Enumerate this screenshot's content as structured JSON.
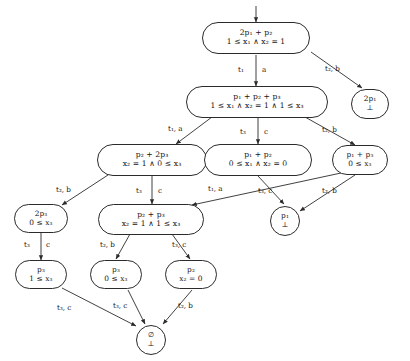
{
  "diagram": {
    "type": "directed-graph",
    "background": "#ffffff",
    "stroke": "#2b2b2b",
    "nodes": [
      {
        "id": "n0",
        "marking": "2p₁ + p₂",
        "guard": "1 ≤ x₁ ∧ x₂ = 1",
        "shape": "rounded"
      },
      {
        "id": "n1",
        "marking": "p₁ + p₂ + p₃",
        "guard": "1 ≤ x₁ ∧ x₂ = 1 ∧ 1 ≤ x₃",
        "shape": "rounded"
      },
      {
        "id": "n2",
        "marking": "2p₁",
        "guard": "⊥",
        "shape": "rounded"
      },
      {
        "id": "n3",
        "marking": "p₂ + 2p₃",
        "guard": "x₂ = 1 ∧ 0 ≤ x₃",
        "shape": "rounded"
      },
      {
        "id": "n4",
        "marking": "p₁ + p₂",
        "guard": "0 ≤ x₁ ∧ x₂ = 0",
        "shape": "rounded"
      },
      {
        "id": "n5",
        "marking": "p₁ + p₃",
        "guard": "0 ≤ x₃",
        "shape": "rounded"
      },
      {
        "id": "n6",
        "marking": "2p₃",
        "guard": "0 ≤ x₃",
        "shape": "rounded"
      },
      {
        "id": "n7",
        "marking": "p₂ + p₃",
        "guard": "x₂ = 1 ∧ 1 ≤ x₃",
        "shape": "rounded"
      },
      {
        "id": "n8",
        "marking": "p₁",
        "guard": "⊥",
        "shape": "circle"
      },
      {
        "id": "n9",
        "marking": "p₃",
        "guard": "1 ≤ x₃",
        "shape": "rounded"
      },
      {
        "id": "n10",
        "marking": "p₃",
        "guard": "0 ≤ x₃",
        "shape": "rounded"
      },
      {
        "id": "n11",
        "marking": "p₂",
        "guard": "x₂ = 0",
        "shape": "rounded"
      },
      {
        "id": "n12",
        "marking": "∅",
        "guard": "⊥",
        "shape": "circle"
      }
    ],
    "edges": [
      {
        "from": "root-arrow",
        "to": "n0",
        "label": ""
      },
      {
        "from": "n0",
        "to": "n1",
        "label": "t₁ | a"
      },
      {
        "from": "n0",
        "to": "n2",
        "label": "t₂, b"
      },
      {
        "from": "n1",
        "to": "n3",
        "label": "t₁, a"
      },
      {
        "from": "n1",
        "to": "n4",
        "label": "t₃ | c"
      },
      {
        "from": "n1",
        "to": "n5",
        "label": "t₂, b"
      },
      {
        "from": "n3",
        "to": "n6",
        "label": "t₂, b"
      },
      {
        "from": "n3",
        "to": "n7",
        "label": "t₃ | c"
      },
      {
        "from": "n4",
        "to": "n8",
        "label": "t₃, c"
      },
      {
        "from": "n5",
        "to": "n7",
        "label": "t₁, a"
      },
      {
        "from": "n5",
        "to": "n8",
        "label": "t₂, b"
      },
      {
        "from": "n6",
        "to": "n9",
        "label": "t₃ | c"
      },
      {
        "from": "n7",
        "to": "n10",
        "label": "t₂, b"
      },
      {
        "from": "n7",
        "to": "n11",
        "label": "t₃, c"
      },
      {
        "from": "n9",
        "to": "n12",
        "label": "t₃, c"
      },
      {
        "from": "n10",
        "to": "n12",
        "label": "t₃, c"
      },
      {
        "from": "n11",
        "to": "n12",
        "label": "t₂, b"
      }
    ],
    "edge_labels": [
      {
        "id": "l0",
        "text": "t₁"
      },
      {
        "id": "l0b",
        "text": "a"
      },
      {
        "id": "l1",
        "text": "t₂, b"
      },
      {
        "id": "l2",
        "text": "t₁, a"
      },
      {
        "id": "l3",
        "text": "t₃"
      },
      {
        "id": "l3b",
        "text": "c"
      },
      {
        "id": "l4",
        "text": "t₂, b"
      },
      {
        "id": "l5",
        "text": "t₂, b"
      },
      {
        "id": "l6",
        "text": "t₃"
      },
      {
        "id": "l6b",
        "text": "c"
      },
      {
        "id": "l7",
        "text": "t₁, a"
      },
      {
        "id": "l8",
        "text": "t₃, c"
      },
      {
        "id": "l9",
        "text": "t₂, b"
      },
      {
        "id": "l10",
        "text": "t₃"
      },
      {
        "id": "l10b",
        "text": "c"
      },
      {
        "id": "l11",
        "text": "t₂, b"
      },
      {
        "id": "l12",
        "text": "t₃, c"
      },
      {
        "id": "l13",
        "text": "t₃, c"
      },
      {
        "id": "l14",
        "text": "t₃, c"
      },
      {
        "id": "l15",
        "text": "t₂, b"
      }
    ]
  }
}
